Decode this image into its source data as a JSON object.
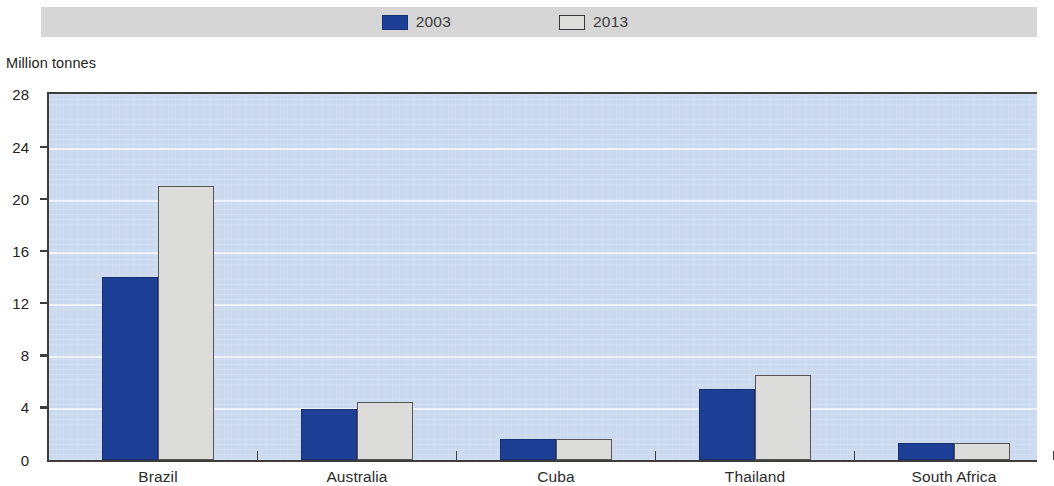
{
  "legend": {
    "entries": [
      {
        "label": "2003",
        "color": "#1d3f96",
        "swatch": "filled"
      },
      {
        "label": "2013",
        "color": "#dededc",
        "swatch": "outline"
      }
    ]
  },
  "axis": {
    "unit_title": "Million tonnes"
  },
  "chart_data": {
    "type": "bar",
    "title": "",
    "subtitle": "",
    "xlabel": "",
    "ylabel": "Million tonnes",
    "ylim": [
      0,
      28
    ],
    "yticks": [
      0,
      4,
      8,
      12,
      16,
      20,
      24,
      28
    ],
    "ytick_labels": [
      "0",
      "4",
      "8",
      "12",
      "16",
      "20",
      "24",
      "28"
    ],
    "grid": true,
    "grid_axis": "y",
    "legend_position": "top-center",
    "categories": [
      "Brazil",
      "Australia",
      "Cuba",
      "Thailand",
      "South Africa"
    ],
    "series": [
      {
        "name": "2003",
        "color": "#1d3f96",
        "values": [
          14.0,
          3.9,
          1.6,
          5.4,
          1.3
        ]
      },
      {
        "name": "2013",
        "color": "#dcdcda",
        "values": [
          21.0,
          4.4,
          1.6,
          6.5,
          1.3
        ]
      }
    ],
    "colors": {
      "plot_background": "#ccdaf0",
      "gridline": "#edf3fb",
      "axis": "#3d3d3d",
      "legend_band": "#d6d6d6",
      "text": "#232323"
    }
  }
}
